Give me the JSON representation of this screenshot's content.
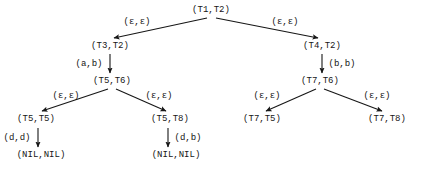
{
  "diagram": {
    "type": "tree",
    "width": 422,
    "height": 172,
    "background_color": "#ffffff",
    "ink_color": "#161616",
    "font_size_px": 9,
    "nodes": [
      {
        "id": "n0",
        "label": "(T1,T2)",
        "x": 211,
        "y": 10
      },
      {
        "id": "n1",
        "label": "(T3,T2)",
        "x": 110,
        "y": 46
      },
      {
        "id": "n2",
        "label": "(T4,T2)",
        "x": 322,
        "y": 46
      },
      {
        "id": "n3",
        "label": "(T5,T6)",
        "x": 112,
        "y": 81
      },
      {
        "id": "n4",
        "label": "(T7,T6)",
        "x": 320,
        "y": 81
      },
      {
        "id": "n5",
        "label": "(T5,T5)",
        "x": 36,
        "y": 119
      },
      {
        "id": "n6",
        "label": "(T5,T8)",
        "x": 170,
        "y": 119
      },
      {
        "id": "n7",
        "label": "(T7,T5)",
        "x": 262,
        "y": 119
      },
      {
        "id": "n8",
        "label": "(T7,T8)",
        "x": 387,
        "y": 119
      },
      {
        "id": "n9",
        "label": "(NIL,NIL)",
        "x": 41,
        "y": 155
      },
      {
        "id": "n10",
        "label": "(NIL,NIL)",
        "x": 176,
        "y": 155
      }
    ],
    "edges": [
      {
        "id": "e0",
        "from": "n0",
        "to": "n1",
        "label": "(ε,ε)",
        "label_x": 137,
        "label_y": 22,
        "x1": 207,
        "y1": 18,
        "x2": 114,
        "y2": 38
      },
      {
        "id": "e1",
        "from": "n0",
        "to": "n2",
        "label": "(ε,ε)",
        "label_x": 285,
        "label_y": 22,
        "x1": 216,
        "y1": 18,
        "x2": 318,
        "y2": 38
      },
      {
        "id": "e2",
        "from": "n1",
        "to": "n3",
        "label": "(a,b)",
        "label_x": 89,
        "label_y": 64,
        "x1": 110,
        "y1": 54,
        "x2": 110,
        "y2": 73
      },
      {
        "id": "e3",
        "from": "n2",
        "to": "n4",
        "label": "(b,b)",
        "label_x": 342,
        "label_y": 64,
        "x1": 322,
        "y1": 54,
        "x2": 322,
        "y2": 73
      },
      {
        "id": "e4",
        "from": "n3",
        "to": "n5",
        "label": "(ε,ε)",
        "label_x": 66,
        "label_y": 96,
        "x1": 108,
        "y1": 89,
        "x2": 42,
        "y2": 111
      },
      {
        "id": "e5",
        "from": "n3",
        "to": "n6",
        "label": "(ε,ε)",
        "label_x": 159,
        "label_y": 96,
        "x1": 116,
        "y1": 89,
        "x2": 166,
        "y2": 111
      },
      {
        "id": "e6",
        "from": "n4",
        "to": "n7",
        "label": "(ε,ε)",
        "label_x": 267,
        "label_y": 96,
        "x1": 316,
        "y1": 89,
        "x2": 266,
        "y2": 111
      },
      {
        "id": "e7",
        "from": "n4",
        "to": "n8",
        "label": "(ε,ε)",
        "label_x": 377,
        "label_y": 96,
        "x1": 324,
        "y1": 89,
        "x2": 382,
        "y2": 111
      },
      {
        "id": "e8",
        "from": "n5",
        "to": "n9",
        "label": "(d,d)",
        "label_x": 17,
        "label_y": 138,
        "x1": 38,
        "y1": 128,
        "x2": 38,
        "y2": 147
      },
      {
        "id": "e9",
        "from": "n6",
        "to": "n10",
        "label": "(d,b)",
        "label_x": 188,
        "label_y": 138,
        "x1": 168,
        "y1": 128,
        "x2": 168,
        "y2": 147
      }
    ]
  }
}
